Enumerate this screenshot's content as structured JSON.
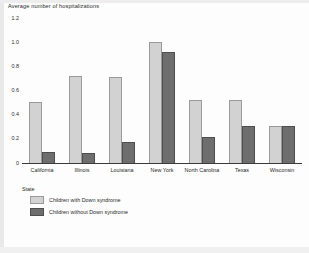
{
  "caption_partial": "",
  "colors": {
    "series_light": "#d2d2d2",
    "series_dark": "#6e6e6e",
    "axis": "#3a3a3a",
    "text": "#2a2a2a",
    "background": "#fdfdfd"
  },
  "legend": {
    "position": "below-axis-left",
    "entries": [
      {
        "label": "Children with Down syndrome",
        "swatch": "light"
      },
      {
        "label": "Children without Down syndrome",
        "swatch": "dark"
      }
    ]
  },
  "chart_data": {
    "type": "bar",
    "title": "Average number of hospitalizations",
    "xlabel": "State",
    "ylabel": "",
    "ylim": [
      0,
      1.2
    ],
    "yticks": [
      "0",
      "0.2",
      "0.4",
      "0.6",
      "0.8",
      "1.0",
      "1.2"
    ],
    "grid": false,
    "categories": [
      "California",
      "Illinois",
      "Louisiana",
      "New York",
      "North Carolina",
      "Texas",
      "Wisconsin"
    ],
    "series": [
      {
        "name": "Children with Down syndrome",
        "color": "#d2d2d2",
        "values": [
          0.5,
          0.72,
          0.71,
          1.0,
          0.52,
          0.52,
          0.3
        ]
      },
      {
        "name": "Children without Down syndrome",
        "color": "#6e6e6e",
        "values": [
          0.09,
          0.08,
          0.17,
          0.92,
          0.21,
          0.3,
          0.3
        ]
      }
    ]
  }
}
